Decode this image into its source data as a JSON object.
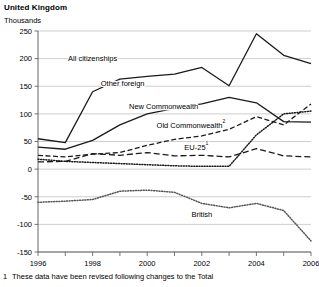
{
  "header": {
    "title": "United Kingdom",
    "axis_unit": "Thousands"
  },
  "footnote": {
    "marker": "1",
    "text": "These data have been revised following changes to the Total"
  },
  "chart_data": {
    "type": "line",
    "title": "United Kingdom",
    "subtitle": "Thousands",
    "xlabel": "",
    "ylabel": "Thousands",
    "xlim": [
      1996,
      2006
    ],
    "ylim": [
      -150,
      250
    ],
    "ytick_values": [
      250,
      200,
      150,
      100,
      50,
      0,
      -50,
      -100,
      -150
    ],
    "ytick_labels": [
      "250",
      "200",
      "150",
      "100",
      "50",
      "0",
      "-50",
      "-100",
      "-150"
    ],
    "xtick_values": [
      1996,
      1997,
      1998,
      1999,
      2000,
      2001,
      2002,
      2003,
      2004,
      2005,
      2006
    ],
    "xtick_labels": [
      "1996",
      "",
      "1998",
      "",
      "2000",
      "",
      "2002",
      "",
      "2004",
      "",
      "2006"
    ],
    "grid": "horizontal",
    "legend": "inline-labels",
    "x": [
      1996,
      1997,
      1998,
      1999,
      2000,
      2001,
      2002,
      2003,
      2004,
      2005,
      2006
    ],
    "series": [
      {
        "name": "All citizenships",
        "style": "solid",
        "color": "#1a1a1a",
        "label": "All citizenships",
        "label_x": 1998.0,
        "label_y": 196,
        "values": [
          55,
          48,
          140,
          163,
          168,
          172,
          184,
          151,
          245,
          206,
          191
        ]
      },
      {
        "name": "Other foreign",
        "style": "solid",
        "color": "#1a1a1a",
        "label": "Other foreign",
        "label_x": 1999.1,
        "label_y": 150,
        "values": [
          40,
          36,
          52,
          80,
          100,
          110,
          118,
          130,
          120,
          86,
          85
        ]
      },
      {
        "name": "New Commonwealth",
        "style": "dashed",
        "color": "#1a1a1a",
        "label": "New Commonwealth",
        "label_x": 2000.6,
        "label_y": 108,
        "values": [
          25,
          22,
          27,
          30,
          43,
          54,
          60,
          72,
          95,
          80,
          118
        ]
      },
      {
        "name": "Old Commonwealth",
        "style": "dashed-long",
        "color": "#1a1a1a",
        "label": "Old Commonwealth",
        "label_superscript": "2",
        "label_x": 2001.6,
        "label_y": 74,
        "values": [
          13,
          14,
          28,
          25,
          30,
          24,
          25,
          22,
          37,
          24,
          22
        ]
      },
      {
        "name": "EU-25",
        "style": "dotted",
        "color": "#1a1a1a",
        "label": "EU-25",
        "label_superscript": "1",
        "label_x": 2001.8,
        "label_y": 34,
        "values": [
          18,
          14,
          12,
          10,
          8,
          6,
          5,
          5,
          62,
          100,
          105
        ]
      },
      {
        "name": "British",
        "style": "dotted",
        "color": "#555555",
        "label": "British",
        "label_x": 2002.0,
        "label_y": -86,
        "values": [
          -60,
          -58,
          -55,
          -40,
          -38,
          -42,
          -62,
          -70,
          -62,
          -75,
          -130
        ]
      }
    ]
  }
}
